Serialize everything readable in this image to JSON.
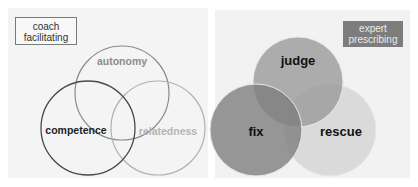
{
  "left_panel": {
    "tag": [
      "coach",
      "facilitating"
    ],
    "circles": [
      {
        "label": "autonomy",
        "cx": 122,
        "cy": 93,
        "r": 47,
        "stroke": "#8a8a8a",
        "text_color": "#8c8c8c"
      },
      {
        "label": "competence",
        "cx": 88,
        "cy": 128,
        "r": 47,
        "stroke": "#4a4a4a",
        "text_color": "#222222"
      },
      {
        "label": "relatedness",
        "cx": 158,
        "cy": 128,
        "r": 47,
        "stroke": "#b0b0b0",
        "text_color": "#b5b5b5"
      }
    ]
  },
  "right_panel": {
    "tag": [
      "expert",
      "prescribing"
    ],
    "circles": [
      {
        "label": "judge",
        "cx": 298,
        "cy": 82,
        "r": 45,
        "fill": "#a8a8a8",
        "text_color": "#111111"
      },
      {
        "label": "fix",
        "cx": 256,
        "cy": 130,
        "r": 46,
        "fill": "#8e8e8e",
        "text_color": "#111111"
      },
      {
        "label": "rescue",
        "cx": 330,
        "cy": 130,
        "r": 46,
        "fill": "#dcdcdc",
        "text_color": "#111111"
      }
    ]
  },
  "colors": {
    "panel_bg": "#f4f4f4",
    "expert_box_bg": "#7d7d7d",
    "coach_box_border": "#7a7a7a"
  }
}
